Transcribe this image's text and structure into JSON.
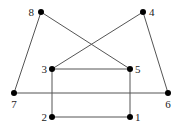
{
  "diagram": {
    "type": "graph",
    "nodes": [
      {
        "id": "1",
        "label": "1"
      },
      {
        "id": "2",
        "label": "2"
      },
      {
        "id": "3",
        "label": "3"
      },
      {
        "id": "4",
        "label": "4"
      },
      {
        "id": "5",
        "label": "5"
      },
      {
        "id": "6",
        "label": "6"
      },
      {
        "id": "7",
        "label": "7"
      },
      {
        "id": "8",
        "label": "8"
      }
    ],
    "edges": [
      [
        "8",
        "5"
      ],
      [
        "8",
        "7"
      ],
      [
        "4",
        "3"
      ],
      [
        "4",
        "6"
      ],
      [
        "3",
        "5"
      ],
      [
        "3",
        "2"
      ],
      [
        "5",
        "1"
      ],
      [
        "2",
        "1"
      ],
      [
        "7",
        "6"
      ]
    ],
    "colors": {
      "edge": "#555555",
      "node": "#000000",
      "label": "#222222"
    }
  }
}
